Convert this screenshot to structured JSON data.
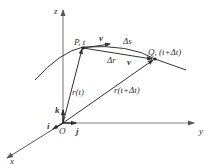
{
  "diagram": {
    "axes": {
      "x_label": "x",
      "y_label": "y",
      "z_label": "z",
      "origin_label": "O"
    },
    "unit_vectors": {
      "i_label": "i",
      "j_label": "j",
      "k_label": "k"
    },
    "points": {
      "P_label": "P, t",
      "Q_label": "Q, (t+Δt)"
    },
    "vectors": {
      "r_t_label": "r(t)",
      "r_t_dt_label": "r(t+Δt)",
      "delta_r_label": "Δr",
      "v_at_P_label": "v",
      "v_at_Q_label": "v"
    },
    "arc": {
      "delta_s_label": "Δs"
    },
    "colors": {
      "line": "#333333",
      "axis": "#666666",
      "background": "#ffffff"
    }
  }
}
